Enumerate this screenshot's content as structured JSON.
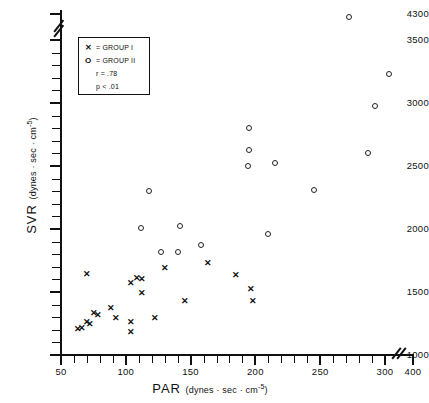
{
  "chart_data": {
    "type": "scatter",
    "title": "",
    "xlabel": "PAR  (dynes·sec·cm−5)",
    "ylabel": "SVR  (dynes·sec·cm−5)",
    "xlabel_main": "PAR",
    "xlabel_unit": "(dynes · sec · cm",
    "ylabel_main": "SVR",
    "ylabel_unit": "(dynes · sec · cm",
    "unit_exponent": "-5",
    "unit_close": ")",
    "xlim": [
      50,
      400
    ],
    "ylim": [
      1000,
      4300
    ],
    "xticks": [
      50,
      100,
      150,
      200,
      250,
      300,
      400
    ],
    "yticks": [
      1000,
      1500,
      2000,
      2500,
      3000,
      3500,
      4300
    ],
    "xtick_labels": [
      "50",
      "100",
      "150",
      "200",
      "250",
      "300",
      "400"
    ],
    "ytick_labels": [
      "1000",
      "1500",
      "2000",
      "2500",
      "3000",
      "3500",
      "4300"
    ],
    "axis_break_x": true,
    "axis_break_y": true,
    "grid": false,
    "series": [
      {
        "name": "GROUP I",
        "marker": "x",
        "points": [
          [
            63,
            1205
          ],
          [
            66,
            1210
          ],
          [
            70,
            1255
          ],
          [
            72,
            1240
          ],
          [
            75,
            1330
          ],
          [
            78,
            1310
          ],
          [
            70,
            1640
          ],
          [
            88,
            1370
          ],
          [
            92,
            1290
          ],
          [
            104,
            1255
          ],
          [
            104,
            1175
          ],
          [
            104,
            1570
          ],
          [
            108,
            1610
          ],
          [
            112,
            1600
          ],
          [
            112,
            1490
          ],
          [
            122,
            1290
          ],
          [
            130,
            1690
          ],
          [
            145,
            1425
          ],
          [
            163,
            1730
          ],
          [
            185,
            1630
          ],
          [
            196,
            1520
          ],
          [
            198,
            1425
          ]
        ]
      },
      {
        "name": "GROUP II",
        "marker": "o",
        "points": [
          [
            118,
            2300
          ],
          [
            112,
            2010
          ],
          [
            127,
            1820
          ],
          [
            142,
            2020
          ],
          [
            140,
            1820
          ],
          [
            158,
            1870
          ],
          [
            195,
            2800
          ],
          [
            195,
            2630
          ],
          [
            194,
            2500
          ],
          [
            215,
            2520
          ],
          [
            210,
            1960
          ],
          [
            245,
            2310
          ],
          [
            272,
            4210
          ],
          [
            292,
            2980
          ],
          [
            287,
            2600
          ],
          [
            315,
            3230
          ]
        ]
      }
    ],
    "annotations": {
      "r": "r  =  .78",
      "p": "p <  .01"
    }
  },
  "legend": {
    "rows": [
      {
        "symbol": "✕",
        "text": "=  GROUP I"
      },
      {
        "symbol": "O",
        "text": "=  GROUP II"
      },
      {
        "symbol": "",
        "text": "r  =  .78"
      },
      {
        "symbol": "",
        "text": "p <  .01"
      }
    ]
  }
}
